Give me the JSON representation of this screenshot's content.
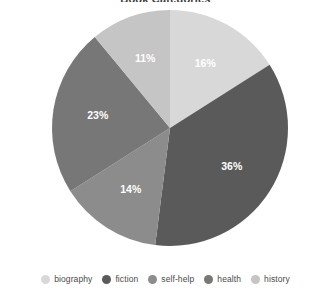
{
  "chart_data": {
    "type": "pie",
    "title": "Book Categories",
    "xlabel": "",
    "ylabel": "",
    "categories": [
      "biography",
      "fiction",
      "self-help",
      "health",
      "history"
    ],
    "values": [
      16,
      36,
      14,
      23,
      11
    ],
    "value_labels": [
      "16%",
      "36%",
      "14%",
      "23%",
      "11%"
    ],
    "colors": [
      "#d8d8d8",
      "#5a5a5a",
      "#8c8c8c",
      "#777777",
      "#c5c5c5"
    ],
    "label_colors": [
      "#ffffff",
      "#ffffff",
      "#ffffff",
      "#ffffff",
      "#ffffff"
    ],
    "start_angle_deg": 0,
    "direction": "clockwise",
    "grid": false,
    "legend_position": "bottom",
    "legend": [
      {
        "label": "biography",
        "color": "#d8d8d8",
        "value": 16
      },
      {
        "label": "fiction",
        "color": "#5a5a5a",
        "value": 36
      },
      {
        "label": "self-help",
        "color": "#8c8c8c",
        "value": 14
      },
      {
        "label": "health",
        "color": "#777777",
        "value": 23
      },
      {
        "label": "history",
        "color": "#c5c5c5",
        "value": 11
      }
    ],
    "geometry": {
      "center_x": 170,
      "center_y": 128,
      "radius": 118,
      "label_radius_ratio": 0.62
    },
    "background": "#ffffff"
  }
}
